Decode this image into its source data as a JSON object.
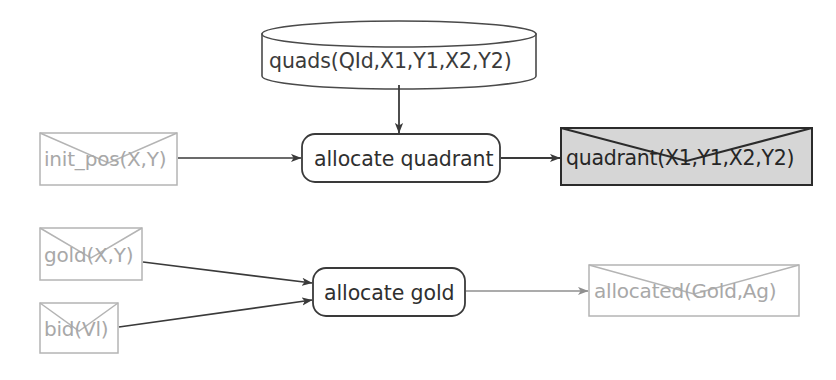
{
  "diagram": {
    "type": "dataflow-diagram",
    "background_color": "#ffffff",
    "colors": {
      "dim_stroke": "#b4b4b4",
      "dim_text": "#a8a8a8",
      "dark_stroke": "#3a3a3a",
      "dark_text": "#2f2f2f",
      "highlight_fill": "#d6d6d6",
      "highlight_stroke": "#2b2b2b",
      "highlight_text": "#262626",
      "arrow_dark": "#3a3a3a",
      "arrow_dim": "#9a9a9a"
    },
    "nodes": [
      {
        "id": "quads-store",
        "shape": "cylinder",
        "label": "quads(QId,X1,Y1,X2,Y2)",
        "style": "dark"
      },
      {
        "id": "init-pos-message",
        "shape": "envelope",
        "label": "init_pos(X,Y)",
        "style": "dim"
      },
      {
        "id": "allocate-quadrant-process",
        "shape": "rounded-rect",
        "label": "allocate quadrant",
        "style": "dark"
      },
      {
        "id": "quadrant-message",
        "shape": "envelope",
        "label": "quadrant(X1,Y1,X2,Y2)",
        "style": "highlight"
      },
      {
        "id": "gold-message",
        "shape": "envelope",
        "label": "gold(X,Y)",
        "style": "dim"
      },
      {
        "id": "bid-message",
        "shape": "envelope",
        "label": "bid(Vl)",
        "style": "dim"
      },
      {
        "id": "allocate-gold-process",
        "shape": "rounded-rect",
        "label": "allocate gold",
        "style": "dark"
      },
      {
        "id": "allocated-message",
        "shape": "envelope",
        "label": "allocated(Gold,Ag)",
        "style": "dim"
      }
    ],
    "edges": [
      {
        "id": "edge-quads-to-allocate-quadrant",
        "from": "quads-store",
        "to": "allocate-quadrant-process",
        "style": "dark"
      },
      {
        "id": "edge-init-pos-to-allocate-quadrant",
        "from": "init-pos-message",
        "to": "allocate-quadrant-process",
        "style": "dark"
      },
      {
        "id": "edge-allocate-quadrant-to-quadrant",
        "from": "allocate-quadrant-process",
        "to": "quadrant-message",
        "style": "dark"
      },
      {
        "id": "edge-gold-to-allocate-gold",
        "from": "gold-message",
        "to": "allocate-gold-process",
        "style": "dark"
      },
      {
        "id": "edge-bid-to-allocate-gold",
        "from": "bid-message",
        "to": "allocate-gold-process",
        "style": "dark"
      },
      {
        "id": "edge-allocate-gold-to-allocated",
        "from": "allocate-gold-process",
        "to": "allocated-message",
        "style": "dim"
      }
    ]
  }
}
